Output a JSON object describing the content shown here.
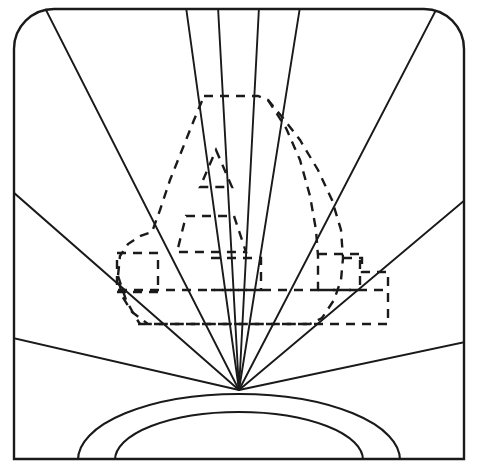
{
  "document": {
    "title": "Sunrise Line Art with Dashed Overlay Shapes",
    "type": "line-drawing",
    "width": 478,
    "height": 468,
    "background_color": "#ffffff",
    "stroke_color": "#1a1a1a",
    "solid_stroke_width": 1.9,
    "dashed_stroke_width": 2.4,
    "dash_pattern": "9 7"
  },
  "frame": {
    "name": "outer-border",
    "description": "Rectangular border with rounded top corners and square bottom corners",
    "x": 14,
    "y": 8,
    "width": 450,
    "height": 452,
    "corner_radius_top": 40,
    "corner_radius_bottom": 0
  },
  "sun": {
    "name": "sunrise-sun",
    "description": "Two concentric half-arcs rising from the bottom edge",
    "center_x": 239,
    "baseline_y": 459,
    "outer_radius_x": 161,
    "outer_radius_y": 66,
    "inner_radius_x": 124,
    "inner_radius_y": 48
  },
  "rays": {
    "name": "sun-rays",
    "origin_x": 239,
    "origin_y": 390,
    "count": 10,
    "endpoints": [
      {
        "id": "ray-left-lower",
        "x": 15,
        "y": 338,
        "edge": "left"
      },
      {
        "id": "ray-left-upper",
        "x": 15,
        "y": 192,
        "edge": "left"
      },
      {
        "id": "ray-top-far-left",
        "x": 45,
        "y": 10,
        "edge": "top"
      },
      {
        "id": "ray-top-left",
        "x": 186,
        "y": 9,
        "edge": "top"
      },
      {
        "id": "ray-top-center-left",
        "x": 218,
        "y": 9,
        "edge": "top"
      },
      {
        "id": "ray-top-center-right",
        "x": 259,
        "y": 9,
        "edge": "top"
      },
      {
        "id": "ray-top-right",
        "x": 300,
        "y": 9,
        "edge": "top"
      },
      {
        "id": "ray-top-far-right",
        "x": 437,
        "y": 10,
        "edge": "top"
      },
      {
        "id": "ray-right-upper",
        "x": 463,
        "y": 200,
        "edge": "right"
      },
      {
        "id": "ray-right-lower",
        "x": 463,
        "y": 342,
        "edge": "right"
      }
    ]
  },
  "dashed_shapes": [
    {
      "name": "large-dashed-outline",
      "description": "Large irregular dashed outline resembling a tall rounded figure",
      "points": "204,96 258,96 268,99 300,135 330,180 343,228 343,258 360,258 360,272 388,272 388,324 295,324 200,324 148,324 118,290 118,252 152,252 158,238 165,200 178,150 190,118"
    },
    {
      "name": "dashed-rectangle-left",
      "description": "Left rectangular dashed box",
      "points": "117,253 158,253 158,292 117,292"
    },
    {
      "name": "dashed-band-horizontal",
      "description": "Long horizontal dashed band crossing the centre",
      "points": "118,290 388,290"
    },
    {
      "name": "dashed-rectangle-center",
      "description": "Small dashed box near the centre",
      "points": "210,258 260,258 260,290 210,290"
    },
    {
      "name": "dashed-rectangle-right",
      "description": "Small dashed box on the right side",
      "points": "318,254 360,254 360,290 318,290"
    },
    {
      "name": "dashed-trapezoid",
      "description": "Mid-size dashed trapezoid (mouth shape)",
      "points": "185,215 233,215 245,252 178,252"
    },
    {
      "name": "dashed-triangle",
      "description": "Small dashed triangle (nose shape)",
      "points": "215,150 230,186 200,186"
    },
    {
      "name": "dashed-lower-baseline",
      "description": "Lower dashed horizontal run along the bottom of the figure",
      "points": "135,324 388,324"
    }
  ],
  "labels": {
    "none_visible": ""
  }
}
